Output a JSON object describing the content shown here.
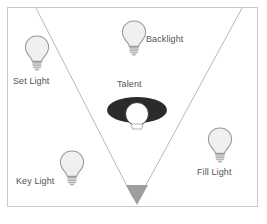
{
  "diagram": {
    "canvas": {
      "width": 267,
      "height": 224,
      "background": "#ffffff"
    },
    "frame": {
      "border_color": "#c9c9c9"
    },
    "colors": {
      "bulb_fill": "#f0f0f0",
      "bulb_stroke": "#9a9a9a",
      "bulb_base": "#b5b5b5",
      "label_text": "#555555",
      "fov_line": "#b0b0b0",
      "camera_marker": "#9e9e9e",
      "talent_body": "#2b2b2b",
      "talent_head": "#ffffff"
    },
    "labels": {
      "set_light": "Set Light",
      "backlight": "Backlight",
      "talent": "Talent",
      "fill_light": "Fill Light",
      "key_light": "Key Light"
    },
    "elements": {
      "camera_marker_name": "camera-triangle-marker",
      "fov_left_name": "field-of-view-line-left",
      "fov_right_name": "field-of-view-line-right"
    }
  }
}
